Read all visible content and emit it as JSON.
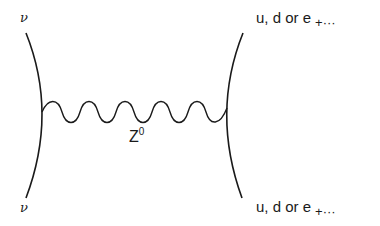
{
  "diagram": {
    "incoming_top": {
      "label": "ν"
    },
    "incoming_bottom": {
      "label": "ν"
    },
    "outgoing_top": {
      "label": "u, d or e",
      "suffix": "+···"
    },
    "outgoing_bottom": {
      "label": "u, d or e",
      "suffix": "+···"
    },
    "propagator": {
      "label": "Z",
      "superscript": "0"
    },
    "colors": {
      "line": "#1a1a1a",
      "background": "#ffffff"
    }
  }
}
